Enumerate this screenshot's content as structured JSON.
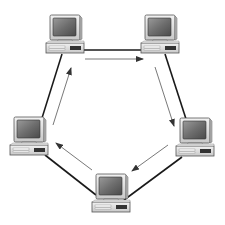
{
  "diagram": {
    "type": "ring-network-topology",
    "background": "#ffffff",
    "cable_color": "#1a1a1a",
    "arrow_color": "#555555",
    "nodes": [
      {
        "id": "pc-top-left",
        "icon": "desktop-computer-icon",
        "x": 47,
        "y": 15
      },
      {
        "id": "pc-top-right",
        "icon": "desktop-computer-icon",
        "x": 141,
        "y": 15
      },
      {
        "id": "pc-right",
        "icon": "desktop-computer-icon",
        "x": 176,
        "y": 118
      },
      {
        "id": "pc-bottom",
        "icon": "desktop-computer-icon",
        "x": 92,
        "y": 174
      },
      {
        "id": "pc-left",
        "icon": "desktop-computer-icon",
        "x": 10,
        "y": 117
      }
    ],
    "cables": [
      {
        "from": "pc-top-left",
        "to": "pc-top-right",
        "x1": 82,
        "y1": 50,
        "x2": 142,
        "y2": 50
      },
      {
        "from": "pc-top-right",
        "to": "pc-right",
        "x1": 165,
        "y1": 54,
        "x2": 186,
        "y2": 119
      },
      {
        "from": "pc-right",
        "to": "pc-bottom",
        "x1": 182,
        "y1": 157,
        "x2": 124,
        "y2": 200
      },
      {
        "from": "pc-bottom",
        "to": "pc-left",
        "x1": 96,
        "y1": 195,
        "x2": 45,
        "y2": 155
      },
      {
        "from": "pc-left",
        "to": "pc-top-left",
        "x1": 42,
        "y1": 118,
        "x2": 62,
        "y2": 54
      }
    ],
    "flow_direction": "clockwise",
    "arrows": [
      {
        "x1": 85,
        "y1": 59,
        "x2": 143,
        "y2": 59
      },
      {
        "x1": 155,
        "y1": 67,
        "x2": 174,
        "y2": 126
      },
      {
        "x1": 168,
        "y1": 145,
        "x2": 132,
        "y2": 171
      },
      {
        "x1": 92,
        "y1": 170,
        "x2": 56,
        "y2": 143
      },
      {
        "x1": 53,
        "y1": 125,
        "x2": 71,
        "y2": 68
      }
    ]
  }
}
